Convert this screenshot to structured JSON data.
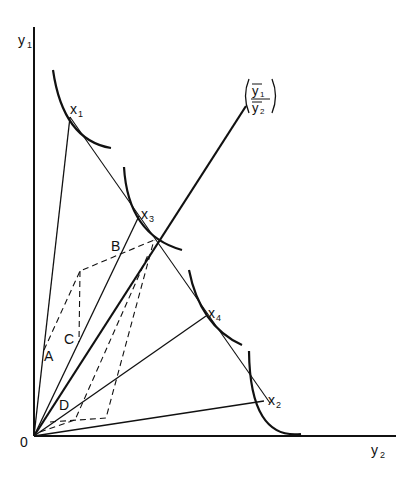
{
  "diagram": {
    "axes": {
      "y_axis_label": "y",
      "y_axis_sub": "1",
      "x_axis_label": "y",
      "x_axis_sub": "2",
      "origin_label": "0"
    },
    "ray_label": {
      "numerator": "y",
      "numerator_sub": "1",
      "denominator": "y",
      "denominator_sub": "2"
    },
    "points": [
      {
        "name": "x",
        "sub": "1"
      },
      {
        "name": "x",
        "sub": "3"
      },
      {
        "name": "x",
        "sub": "4"
      },
      {
        "name": "x",
        "sub": "2"
      }
    ],
    "vector_labels": [
      "A",
      "B",
      "C",
      "D"
    ],
    "colors": {
      "ink": "#111111",
      "background": "#ffffff"
    }
  }
}
